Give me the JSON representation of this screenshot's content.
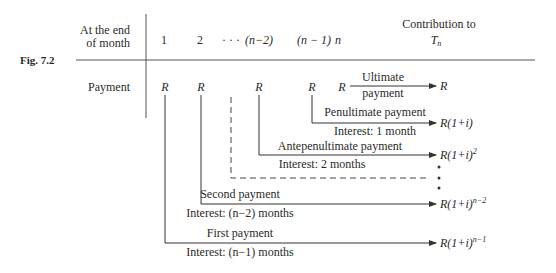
{
  "figure": {
    "label": "Fig. 7.2",
    "header": {
      "row_label_line1": "At the end",
      "row_label_line2": "of month",
      "months": [
        "1",
        "2",
        "· · ·",
        "(n−2)",
        "(n − 1)",
        "n"
      ],
      "contribution_line1": "Contribution to",
      "contribution_line2": "T",
      "contribution_sub": "n"
    },
    "payment_row": {
      "label": "Payment",
      "symbols": [
        "R",
        "R",
        "R",
        "R",
        "R"
      ]
    },
    "flows": [
      {
        "name": "ultimate",
        "label_above": "Ultimate",
        "label_below": "payment",
        "result": "R",
        "result_exp": ""
      },
      {
        "name": "penultimate",
        "label_above": "Penultimate payment",
        "label_below": "Interest: 1 month",
        "result": "R(1+i)",
        "result_exp": ""
      },
      {
        "name": "antepenultimate",
        "label_above": "Antepenultimate payment",
        "label_below": "Interest: 2 months",
        "result": "R(1+i)",
        "result_exp": "2"
      },
      {
        "name": "second",
        "label_above": "Second payment",
        "label_below": "Interest: (n−2)  months",
        "result": "R(1+i)",
        "result_exp": "n−2"
      },
      {
        "name": "first",
        "label_above": "First payment",
        "label_below": "Interest: (n−1)  months",
        "result": "R(1+i)",
        "result_exp": "n−1"
      }
    ],
    "ellipsis": "⋮",
    "colors": {
      "ink": "#2a2a2a",
      "rule": "#555555"
    }
  }
}
